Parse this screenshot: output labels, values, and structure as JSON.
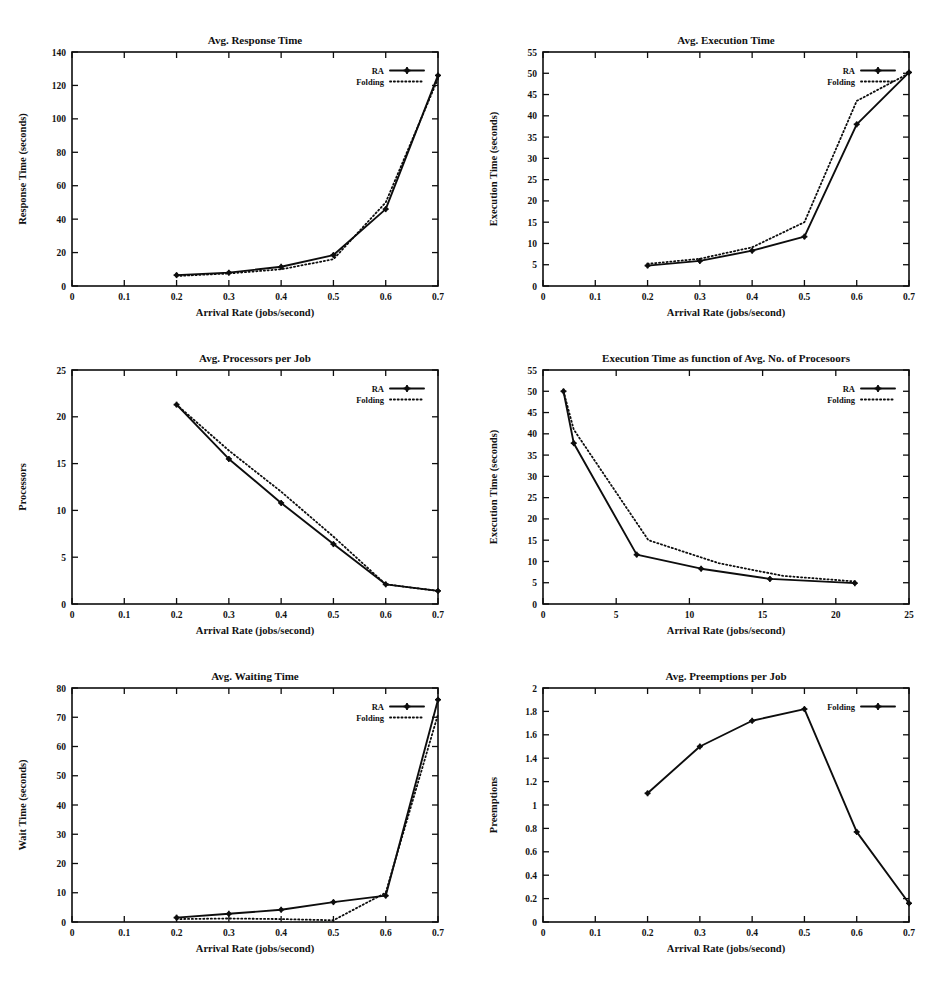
{
  "document": {
    "kind": "figure-sheet",
    "background": "#ffffff",
    "ink": "#0d0d0d",
    "panel_count": 6
  },
  "common": {
    "xlabel": "Arrival Rate (jobs/second)",
    "legend_ra": "RA",
    "legend_folding": "Folding"
  },
  "chart_data": [
    {
      "id": "avg-response-time",
      "type": "line",
      "title": "Avg. Response Time",
      "xlabel": "Arrival Rate (jobs/second)",
      "ylabel": "Response Time (seconds)",
      "xlim": [
        0,
        0.7
      ],
      "ylim": [
        0,
        140
      ],
      "xticks": [
        0,
        0.1,
        0.2,
        0.3,
        0.4,
        0.5,
        0.6,
        0.7
      ],
      "xticklabels": [
        "0",
        "0.1",
        "0.2",
        "0.3",
        "0.4",
        "0.5",
        "0.6",
        "0.7"
      ],
      "yticks": [
        0,
        20,
        40,
        60,
        80,
        100,
        120,
        140
      ],
      "yticklabels": [
        "0",
        "20",
        "40",
        "60",
        "80",
        "100",
        "120",
        "140"
      ],
      "grid": false,
      "legend_position": "top-right",
      "series": [
        {
          "name": "RA",
          "style": "solid",
          "markers": true,
          "x": [
            0.2,
            0.3,
            0.4,
            0.5,
            0.6,
            0.7
          ],
          "values": [
            6.5,
            8.0,
            11.5,
            18.5,
            46.0,
            126.0
          ]
        },
        {
          "name": "Folding",
          "style": "dotted",
          "markers": false,
          "x": [
            0.2,
            0.3,
            0.4,
            0.5,
            0.6,
            0.7
          ],
          "values": [
            6.0,
            7.5,
            10.0,
            16.0,
            50.0,
            124.0
          ]
        }
      ]
    },
    {
      "id": "avg-execution-time",
      "type": "line",
      "title": "Avg. Execution Time",
      "xlabel": "Arrival Rate (jobs/second)",
      "ylabel": "Execution Time (seconds)",
      "xlim": [
        0,
        0.7
      ],
      "ylim": [
        0,
        55
      ],
      "xticks": [
        0,
        0.1,
        0.2,
        0.3,
        0.4,
        0.5,
        0.6,
        0.7
      ],
      "xticklabels": [
        "0",
        "0.1",
        "0.2",
        "0.3",
        "0.4",
        "0.5",
        "0.6",
        "0.7"
      ],
      "yticks": [
        0,
        5,
        10,
        15,
        20,
        25,
        30,
        35,
        40,
        45,
        50,
        55
      ],
      "yticklabels": [
        "0",
        "5",
        "10",
        "15",
        "20",
        "25",
        "30",
        "35",
        "40",
        "45",
        "50",
        "55"
      ],
      "grid": false,
      "legend_position": "top-right",
      "series": [
        {
          "name": "RA",
          "style": "solid",
          "markers": true,
          "x": [
            0.2,
            0.3,
            0.4,
            0.5,
            0.6,
            0.7
          ],
          "values": [
            4.8,
            5.9,
            8.3,
            11.6,
            38.0,
            50.2
          ]
        },
        {
          "name": "Folding",
          "style": "dotted",
          "markers": false,
          "x": [
            0.2,
            0.3,
            0.4,
            0.5,
            0.6,
            0.7
          ],
          "values": [
            5.2,
            6.4,
            9.1,
            15.0,
            43.5,
            50.0
          ]
        }
      ]
    },
    {
      "id": "avg-processors-per-job",
      "type": "line",
      "title": "Avg. Processors per Job",
      "xlabel": "Arrival Rate (jobs/second)",
      "ylabel": "Processors",
      "xlim": [
        0,
        0.7
      ],
      "ylim": [
        0,
        25
      ],
      "xticks": [
        0,
        0.1,
        0.2,
        0.3,
        0.4,
        0.5,
        0.6,
        0.7
      ],
      "xticklabels": [
        "0",
        "0.1",
        "0.2",
        "0.3",
        "0.4",
        "0.5",
        "0.6",
        "0.7"
      ],
      "yticks": [
        0,
        5,
        10,
        15,
        20,
        25
      ],
      "yticklabels": [
        "0",
        "5",
        "10",
        "15",
        "20",
        "25"
      ],
      "grid": false,
      "legend_position": "top-right",
      "series": [
        {
          "name": "RA",
          "style": "solid",
          "markers": true,
          "x": [
            0.2,
            0.3,
            0.4,
            0.5,
            0.6,
            0.7
          ],
          "values": [
            21.3,
            15.5,
            10.8,
            6.4,
            2.1,
            1.4
          ]
        },
        {
          "name": "Folding",
          "style": "dotted",
          "markers": false,
          "x": [
            0.2,
            0.3,
            0.4,
            0.5,
            0.6,
            0.7
          ],
          "values": [
            21.3,
            16.4,
            12.0,
            7.2,
            2.1,
            1.4
          ]
        }
      ]
    },
    {
      "id": "execution-time-vs-processors",
      "type": "line",
      "title": "Execution Time as function of Avg. No. of Procesoors",
      "xlabel": "Arrival Rate (jobs/second)",
      "ylabel": "Execution Time (seconds)",
      "xlim": [
        0,
        25
      ],
      "ylim": [
        0,
        55
      ],
      "xticks": [
        0,
        5,
        10,
        15,
        20,
        25
      ],
      "xticklabels": [
        "0",
        "5",
        "10",
        "15",
        "20",
        "25"
      ],
      "yticks": [
        0,
        5,
        10,
        15,
        20,
        25,
        30,
        35,
        40,
        45,
        50,
        55
      ],
      "yticklabels": [
        "0",
        "5",
        "10",
        "15",
        "20",
        "25",
        "30",
        "35",
        "40",
        "45",
        "50",
        "55"
      ],
      "grid": false,
      "legend_position": "top-right",
      "series": [
        {
          "name": "RA",
          "style": "solid",
          "markers": true,
          "x": [
            1.4,
            2.1,
            6.4,
            10.8,
            15.5,
            21.3
          ],
          "values": [
            50.0,
            37.8,
            11.6,
            8.3,
            5.9,
            4.9
          ]
        },
        {
          "name": "Folding",
          "style": "dotted",
          "markers": false,
          "x": [
            1.4,
            2.1,
            7.2,
            12.0,
            16.4,
            21.3
          ],
          "values": [
            50.0,
            41.0,
            15.0,
            9.6,
            6.6,
            5.3
          ]
        }
      ]
    },
    {
      "id": "avg-waiting-time",
      "type": "line",
      "title": "Avg. Waiting Time",
      "xlabel": "Arrival Rate (jobs/second)",
      "ylabel": "Wait Time (seconds)",
      "xlim": [
        0,
        0.7
      ],
      "ylim": [
        0,
        80
      ],
      "xticks": [
        0,
        0.1,
        0.2,
        0.3,
        0.4,
        0.5,
        0.6,
        0.7
      ],
      "xticklabels": [
        "0",
        "0.1",
        "0.2",
        "0.3",
        "0.4",
        "0.5",
        "0.6",
        "0.7"
      ],
      "yticks": [
        0,
        10,
        20,
        30,
        40,
        50,
        60,
        70,
        80
      ],
      "yticklabels": [
        "0",
        "10",
        "20",
        "30",
        "40",
        "50",
        "60",
        "70",
        "80"
      ],
      "grid": false,
      "legend_position": "top-right",
      "series": [
        {
          "name": "RA",
          "style": "solid",
          "markers": true,
          "x": [
            0.2,
            0.3,
            0.4,
            0.5,
            0.6,
            0.7
          ],
          "values": [
            1.5,
            2.8,
            4.2,
            6.8,
            9.0,
            76.0
          ]
        },
        {
          "name": "Folding",
          "style": "dotted",
          "markers": false,
          "x": [
            0.2,
            0.3,
            0.4,
            0.5,
            0.6,
            0.7
          ],
          "values": [
            1.0,
            1.2,
            1.0,
            0.6,
            10.0,
            71.0
          ]
        }
      ]
    },
    {
      "id": "avg-preemptions-per-job",
      "type": "line",
      "title": "Avg. Preemptions per Job",
      "xlabel": "Arrival Rate (jobs/second)",
      "ylabel": "Preemptions",
      "xlim": [
        0,
        0.7
      ],
      "ylim": [
        0,
        2
      ],
      "xticks": [
        0,
        0.1,
        0.2,
        0.3,
        0.4,
        0.5,
        0.6,
        0.7
      ],
      "xticklabels": [
        "0",
        "0.1",
        "0.2",
        "0.3",
        "0.4",
        "0.5",
        "0.6",
        "0.7"
      ],
      "yticks": [
        0,
        0.2,
        0.4,
        0.6,
        0.8,
        1,
        1.2,
        1.4,
        1.6,
        1.8,
        2
      ],
      "yticklabels": [
        "0",
        "0.2",
        "0.4",
        "0.6",
        "0.8",
        "1",
        "1.2",
        "1.4",
        "1.6",
        "1.8",
        "2"
      ],
      "grid": false,
      "legend_position": "top-right",
      "series": [
        {
          "name": "Folding",
          "style": "solid",
          "markers": true,
          "x": [
            0.2,
            0.3,
            0.4,
            0.5,
            0.6,
            0.7
          ],
          "values": [
            1.1,
            1.5,
            1.72,
            1.82,
            0.77,
            0.16
          ]
        }
      ]
    }
  ],
  "layout": {
    "panels": [
      {
        "chart": 0,
        "left": 0,
        "top": 22
      },
      {
        "chart": 1,
        "left": 471,
        "top": 22
      },
      {
        "chart": 2,
        "left": 0,
        "top": 340
      },
      {
        "chart": 3,
        "left": 471,
        "top": 340
      },
      {
        "chart": 4,
        "left": 0,
        "top": 658
      },
      {
        "chart": 5,
        "left": 471,
        "top": 658
      }
    ]
  }
}
